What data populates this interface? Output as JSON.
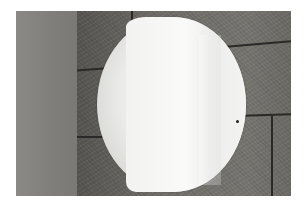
{
  "image": {
    "description": "Photograph of a large pale round disc mounted on a rough stone block wall, with a smooth gray panel on the left, framed by a white border",
    "colors": {
      "border": "#ffffff",
      "panel": "#83827e",
      "wall": "#6b6a66",
      "disc": "#eeeeec",
      "joint": "#2a2927"
    }
  }
}
